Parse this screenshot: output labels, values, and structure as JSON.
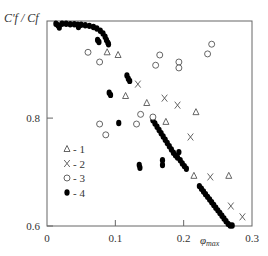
{
  "chart_data": {
    "type": "scatter",
    "title": "",
    "xlabel": "φmax",
    "ylabel": "C'f / Cf",
    "xlim": [
      0,
      0.3
    ],
    "ylim": [
      0.6,
      0.98
    ],
    "xticks": [
      0,
      0.1,
      0.2,
      0.3
    ],
    "xtick_labels": [
      "0",
      "0.1",
      "0.2",
      "0.3"
    ],
    "yticks": [
      0.6,
      0.8
    ],
    "ytick_labels": [
      "0.6",
      "0.8"
    ],
    "grid": false,
    "legend_position": "inside-left",
    "series": [
      {
        "name": "1",
        "marker": "triangle-open",
        "points": [
          [
            0.088,
            0.922
          ],
          [
            0.104,
            0.917
          ],
          [
            0.115,
            0.841
          ],
          [
            0.146,
            0.828
          ],
          [
            0.174,
            0.793
          ],
          [
            0.218,
            0.811
          ],
          [
            0.215,
            0.693
          ],
          [
            0.266,
            0.693
          ]
        ]
      },
      {
        "name": "2",
        "marker": "x",
        "points": [
          [
            0.133,
            0.863
          ],
          [
            0.172,
            0.837
          ],
          [
            0.191,
            0.824
          ],
          [
            0.21,
            0.765
          ],
          [
            0.239,
            0.691
          ],
          [
            0.269,
            0.637
          ],
          [
            0.286,
            0.617
          ]
        ]
      },
      {
        "name": "3",
        "marker": "circle-open",
        "points": [
          [
            0.06,
            0.922
          ],
          [
            0.077,
            0.904
          ],
          [
            0.165,
            0.917
          ],
          [
            0.159,
            0.898
          ],
          [
            0.193,
            0.904
          ],
          [
            0.193,
            0.893
          ],
          [
            0.241,
            0.937
          ],
          [
            0.235,
            0.919
          ],
          [
            0.077,
            0.789
          ],
          [
            0.086,
            0.769
          ],
          [
            0.131,
            0.789
          ],
          [
            0.137,
            0.807
          ],
          [
            0.155,
            0.802
          ]
        ]
      },
      {
        "name": "4",
        "marker": "circle-filled",
        "points": [
          [
            0.013,
            0.975
          ],
          [
            0.016,
            0.972
          ],
          [
            0.018,
            0.968
          ],
          [
            0.022,
            0.975
          ],
          [
            0.028,
            0.975
          ],
          [
            0.034,
            0.974
          ],
          [
            0.04,
            0.974
          ],
          [
            0.045,
            0.973
          ],
          [
            0.046,
            0.969
          ],
          [
            0.05,
            0.973
          ],
          [
            0.056,
            0.972
          ],
          [
            0.062,
            0.971
          ],
          [
            0.068,
            0.969
          ],
          [
            0.073,
            0.966
          ],
          [
            0.078,
            0.962
          ],
          [
            0.082,
            0.957
          ],
          [
            0.085,
            0.951
          ],
          [
            0.087,
            0.945
          ],
          [
            0.089,
            0.94
          ],
          [
            0.09,
            0.937
          ],
          [
            0.074,
            0.945
          ],
          [
            0.076,
            0.941
          ],
          [
            0.117,
            0.879
          ],
          [
            0.119,
            0.873
          ],
          [
            0.121,
            0.869
          ],
          [
            0.091,
            0.847
          ],
          [
            0.093,
            0.843
          ],
          [
            0.105,
            0.791
          ],
          [
            0.135,
            0.713
          ],
          [
            0.136,
            0.708
          ],
          [
            0.169,
            0.722
          ],
          [
            0.169,
            0.713
          ],
          [
            0.155,
            0.796
          ],
          [
            0.158,
            0.79
          ],
          [
            0.161,
            0.784
          ],
          [
            0.164,
            0.778
          ],
          [
            0.167,
            0.772
          ],
          [
            0.17,
            0.766
          ],
          [
            0.173,
            0.76
          ],
          [
            0.176,
            0.754
          ],
          [
            0.179,
            0.748
          ],
          [
            0.182,
            0.742
          ],
          [
            0.185,
            0.736
          ],
          [
            0.188,
            0.731
          ],
          [
            0.191,
            0.727
          ],
          [
            0.193,
            0.737
          ],
          [
            0.195,
            0.722
          ],
          [
            0.198,
            0.716
          ],
          [
            0.201,
            0.711
          ],
          [
            0.204,
            0.706
          ],
          [
            0.223,
            0.674
          ],
          [
            0.226,
            0.669
          ],
          [
            0.229,
            0.664
          ],
          [
            0.232,
            0.659
          ],
          [
            0.235,
            0.654
          ],
          [
            0.238,
            0.649
          ],
          [
            0.241,
            0.644
          ],
          [
            0.244,
            0.639
          ],
          [
            0.247,
            0.634
          ],
          [
            0.25,
            0.629
          ],
          [
            0.253,
            0.624
          ],
          [
            0.256,
            0.619
          ],
          [
            0.259,
            0.614
          ],
          [
            0.262,
            0.609
          ],
          [
            0.265,
            0.604
          ],
          [
            0.268,
            0.601
          ],
          [
            0.271,
            0.601
          ]
        ]
      }
    ],
    "legend": [
      {
        "symbol": "Δ",
        "label": "- 1"
      },
      {
        "symbol": "X",
        "label": "- 2"
      },
      {
        "symbol": "○",
        "label": "- 3"
      },
      {
        "symbol": "●",
        "label": "- 4"
      }
    ]
  },
  "labels": {
    "ylabel": "C'f / Cf",
    "xlabel_main": "φ",
    "xlabel_sub": "max"
  }
}
